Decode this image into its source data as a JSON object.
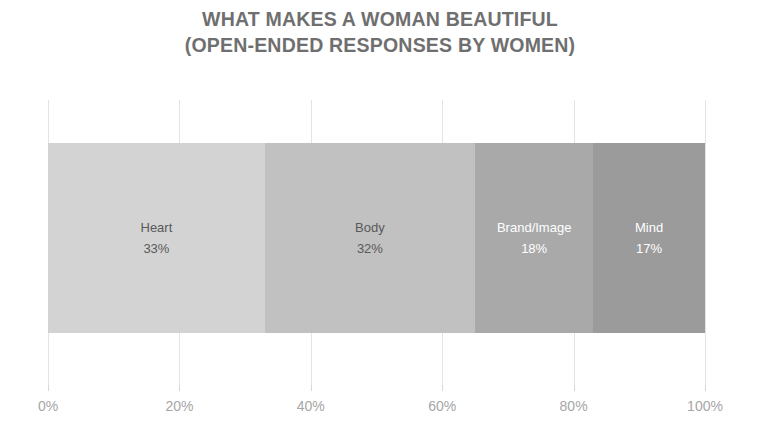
{
  "chart_data": {
    "type": "bar",
    "orientation": "horizontal-stacked",
    "title": "WHAT MAKES A WOMAN BEAUTIFUL (OPEN-ENDED RESPONSES BY WOMEN)",
    "title_lines": [
      "WHAT MAKES A WOMAN BEAUTIFUL",
      "(OPEN-ENDED RESPONSES BY WOMEN)"
    ],
    "xlabel": "",
    "ylabel": "",
    "xlim": [
      0,
      100
    ],
    "grid": true,
    "legend": "none",
    "categories": [
      "Heart",
      "Body",
      "Brand/Image",
      "Mind"
    ],
    "values": [
      33,
      32,
      18,
      17
    ],
    "value_labels": [
      "33%",
      "32%",
      "18%",
      "17%"
    ],
    "segments": [
      {
        "label": "Heart",
        "value": 33,
        "value_label": "33%",
        "color": "#d3d3d3",
        "text_color": "#595959"
      },
      {
        "label": "Body",
        "value": 32,
        "value_label": "32%",
        "color": "#c1c1c1",
        "text_color": "#595959"
      },
      {
        "label": "Brand/Image",
        "value": 18,
        "value_label": "18%",
        "color": "#a9a9a9",
        "text_color": "#ffffff"
      },
      {
        "label": "Mind",
        "value": 17,
        "value_label": "17%",
        "color": "#9b9b9b",
        "text_color": "#ffffff"
      }
    ],
    "x_ticks": [
      {
        "value": 0,
        "label": "0%"
      },
      {
        "value": 20,
        "label": "20%"
      },
      {
        "value": 40,
        "label": "40%"
      },
      {
        "value": 60,
        "label": "60%"
      },
      {
        "value": 80,
        "label": "80%"
      },
      {
        "value": 100,
        "label": "100%"
      }
    ],
    "colors": {
      "title": "#6f6f6f",
      "axis_label": "#a6a6a6",
      "gridline": "#e4e4e4",
      "background": "#ffffff"
    }
  }
}
